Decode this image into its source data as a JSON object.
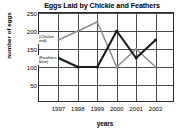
{
  "chart_data": {
    "type": "line",
    "title": "Eggs Laid by Chickie and Feathers",
    "xlabel": "years",
    "ylabel": "number of eggs",
    "categories": [
      "1997",
      "1998",
      "1999",
      "2000",
      "2001",
      "2002"
    ],
    "yticks": [
      50,
      100,
      150,
      200,
      250
    ],
    "ylim": [
      0,
      250
    ],
    "grid": true,
    "legend_position": "inline-annotations",
    "series": [
      {
        "name": "Chickie",
        "annotation": "(Chickie red)",
        "color": "#8c8c8c",
        "values": [
          175,
          200,
          225,
          100,
          150,
          100
        ]
      },
      {
        "name": "Feathers",
        "annotation": "(Feathers blue)",
        "color": "#1a1a1a",
        "values": [
          125,
          100,
          100,
          200,
          125,
          175
        ]
      }
    ]
  },
  "annotations": {
    "chickie_line1": "(Chickie",
    "chickie_line2": "red)",
    "feathers_line1": "(Feathers",
    "feathers_line2": "blue)"
  }
}
